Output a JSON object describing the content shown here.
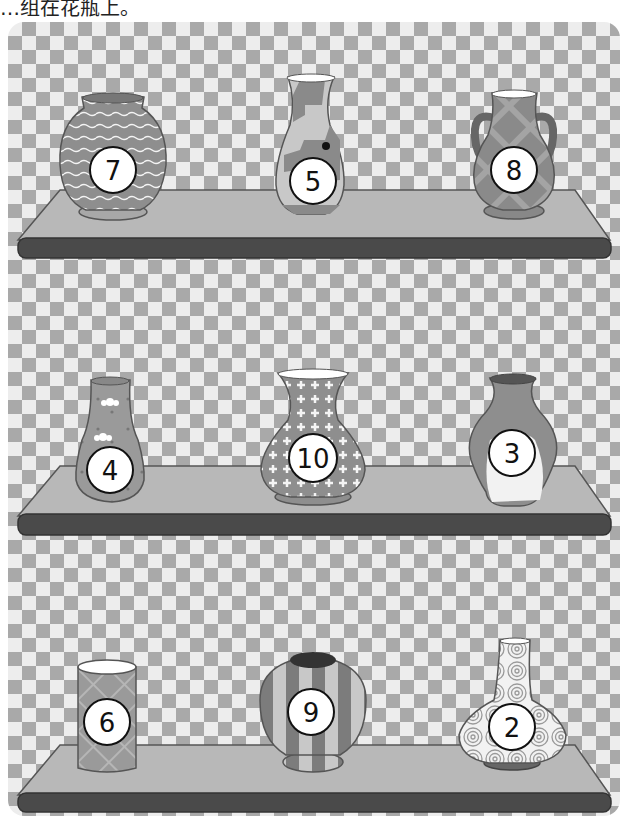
{
  "caption": "…组在花瓶上。",
  "shelves": [
    {
      "id": 1,
      "vases": [
        {
          "number": "7",
          "pattern": "wavy-lines",
          "shape": "round-jar"
        },
        {
          "number": "5",
          "pattern": "geometric-steps",
          "shape": "tall-flask"
        },
        {
          "number": "8",
          "pattern": "plaid",
          "shape": "two-handled-urn"
        }
      ]
    },
    {
      "id": 2,
      "vases": [
        {
          "number": "4",
          "pattern": "flowers-dots",
          "shape": "bottle"
        },
        {
          "number": "10",
          "pattern": "crosses",
          "shape": "bell"
        },
        {
          "number": "3",
          "pattern": "marble-swirl",
          "shape": "urn"
        }
      ]
    },
    {
      "id": 3,
      "vases": [
        {
          "number": "6",
          "pattern": "diamond-floral",
          "shape": "cylinder"
        },
        {
          "number": "9",
          "pattern": "stripes",
          "shape": "globe"
        },
        {
          "number": "2",
          "pattern": "spirals",
          "shape": "long-neck-bulb"
        }
      ]
    }
  ],
  "colors": {
    "checker_dark": "#a9a9a9",
    "checker_light": "#ededed",
    "shelf_top": "#b8b8b8",
    "shelf_front": "#4a4a4a",
    "vase_fill": "#8e8e8e",
    "badge_fill": "#ffffff"
  }
}
